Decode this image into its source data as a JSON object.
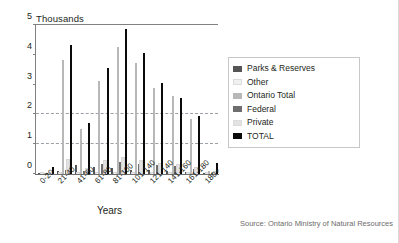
{
  "chart_data": {
    "type": "bar",
    "title": "",
    "unit_caption": "Thousands",
    "xlabel": "Years",
    "ylabel": "",
    "ylim": [
      0,
      5
    ],
    "yticks": [
      0,
      1,
      2,
      3,
      4,
      5
    ],
    "gridlines": [
      1,
      2
    ],
    "grid": true,
    "legend_position": "right",
    "categories": [
      "0-20",
      "21-40",
      "41-60",
      "61-80",
      "81-100",
      "101-140",
      "121-140",
      "141-160",
      "161-180",
      "180+"
    ],
    "series": [
      {
        "name": "Parks & Reserves",
        "color": "#555555",
        "values": [
          0.02,
          0.1,
          0.3,
          0.22,
          0.2,
          0.15,
          0.12,
          0.1,
          0.06,
          0.03
        ]
      },
      {
        "name": "Other",
        "color": "#f0f0f0",
        "values": [
          0.01,
          0.04,
          0.05,
          0.05,
          0.04,
          0.04,
          0.03,
          0.03,
          0.02,
          0.01
        ]
      },
      {
        "name": "Ontario Total",
        "color": "#b8b8b8",
        "values": [
          0.03,
          3.8,
          1.5,
          3.1,
          4.25,
          3.7,
          2.88,
          2.6,
          1.85,
          0.1
        ]
      },
      {
        "name": "Federal",
        "color": "#6e6e6e",
        "values": [
          0.02,
          0.12,
          0.1,
          0.35,
          0.4,
          0.35,
          0.3,
          0.28,
          0.16,
          0.05
        ]
      },
      {
        "name": "Private",
        "color": "#e2e2e2",
        "values": [
          0.02,
          0.46,
          0.18,
          0.42,
          0.52,
          0.45,
          0.32,
          0.3,
          0.2,
          0.06
        ]
      },
      {
        "name": "TOTAL",
        "color": "#0a0a0a",
        "values": [
          0.22,
          4.3,
          1.7,
          3.55,
          4.82,
          4.05,
          3.05,
          2.52,
          1.95,
          0.38
        ]
      }
    ],
    "source": "Source: Ontario Ministry of Natural Resources"
  },
  "legend": {
    "items": [
      {
        "label": "Parks & Reserves",
        "color": "#555555"
      },
      {
        "label": "Other",
        "color": "#f0f0f0"
      },
      {
        "label": "Ontario Total",
        "color": "#b8b8b8"
      },
      {
        "label": "Federal",
        "color": "#6e6e6e"
      },
      {
        "label": "Private",
        "color": "#e2e2e2"
      },
      {
        "label": "TOTAL",
        "color": "#0a0a0a"
      }
    ]
  }
}
